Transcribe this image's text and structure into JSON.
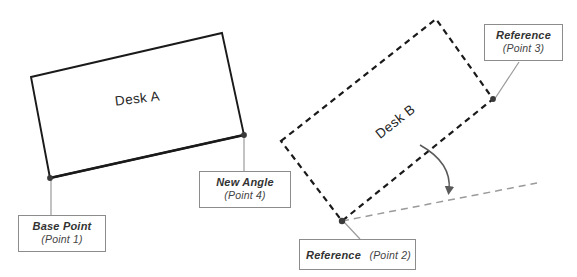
{
  "diagram": {
    "background_color": "#ffffff",
    "solid_stroke_color": "#1a1a1a",
    "dashed_stroke_color": "#1a1a1a",
    "reference_line_color": "#8c8c8c",
    "leader_line_color": "#8c8c8c",
    "callout_border_color": "#8c8c8c",
    "marker_color": "#3a3a3a"
  },
  "shapes": {
    "desk_a": {
      "label": "Desk A",
      "style": "solid",
      "label_rotation_deg": -7,
      "label_x": 138,
      "label_y": 103,
      "corners": [
        {
          "x": 31,
          "y": 77
        },
        {
          "x": 222,
          "y": 33
        },
        {
          "x": 244,
          "y": 135
        },
        {
          "x": 50,
          "y": 178
        }
      ]
    },
    "desk_b": {
      "label": "Desk B",
      "style": "dashed",
      "label_rotation_deg": -38,
      "label_x": 398,
      "label_y": 125,
      "corners": [
        {
          "x": 281,
          "y": 141
        },
        {
          "x": 436,
          "y": 19
        },
        {
          "x": 493,
          "y": 99
        },
        {
          "x": 342,
          "y": 221
        }
      ]
    }
  },
  "markers": [
    {
      "name": "point-1-marker",
      "x": 50,
      "y": 178
    },
    {
      "name": "point-4-marker",
      "x": 244,
      "y": 135
    },
    {
      "name": "point-3-marker",
      "x": 493,
      "y": 99
    },
    {
      "name": "point-2-marker",
      "x": 342,
      "y": 221
    }
  ],
  "reference_line": {
    "from": {
      "x": 342,
      "y": 221
    },
    "to": {
      "x": 537,
      "y": 183
    },
    "style": "dashed"
  },
  "angle_arc": {
    "from": {
      "x": 420,
      "y": 145
    },
    "to": {
      "x": 449,
      "y": 194
    },
    "arrow": "down"
  },
  "callouts": {
    "base_point": {
      "title": "Base Point",
      "sub": "(Point 1)",
      "leader_from": {
        "x": 51,
        "y": 215
      },
      "leader_to": {
        "x": 51,
        "y": 180
      }
    },
    "new_angle": {
      "title": "New Angle",
      "sub": "(Point 4)",
      "leader_from": {
        "x": 244,
        "y": 171
      },
      "leader_to": {
        "x": 244,
        "y": 137
      }
    },
    "reference_point_3": {
      "title": "Reference",
      "sub": "(Point 3)",
      "leader_from": {
        "x": 519,
        "y": 62
      },
      "leader_to": {
        "x": 494,
        "y": 100
      }
    },
    "reference_point_2": {
      "title": "Reference",
      "sub": "(Point 2)",
      "leader_from": {
        "x": 360,
        "y": 239
      },
      "leader_to": {
        "x": 344,
        "y": 222
      }
    }
  }
}
